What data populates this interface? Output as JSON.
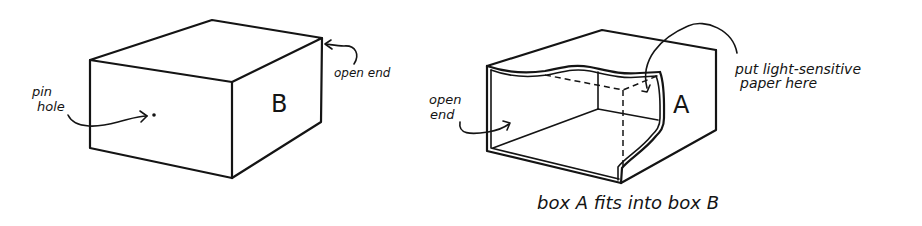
{
  "figure": {
    "box_b": {
      "letter": "B",
      "labels": {
        "pin_hole_line1": "pin",
        "pin_hole_line2": "hole",
        "open_end": "open end"
      }
    },
    "box_a": {
      "letter": "A",
      "labels": {
        "open_end_line1": "open",
        "open_end_line2": "end",
        "paper_line1": "put light-sensitive",
        "paper_line2": "paper here"
      }
    },
    "caption": "box A fits into box B"
  },
  "colors": {
    "ink": "#141414",
    "background": "#ffffff"
  }
}
